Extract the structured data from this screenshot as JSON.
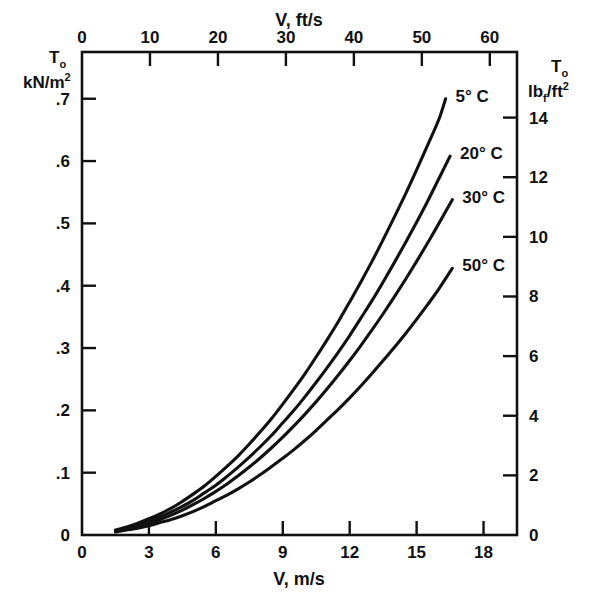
{
  "chart_data": {
    "type": "line",
    "title": "",
    "xlabel": "V, m/s",
    "xlabel_top": "V, ft/s",
    "ylabel": "T_o kN/m^2",
    "ylabel_right": "T_o lb_f/ft^2",
    "xlim": [
      0,
      19.5
    ],
    "ylim": [
      0,
      0.775
    ],
    "xlim_top_fts": [
      0,
      64
    ],
    "ylim_right_lbfft2": [
      0,
      16.2
    ],
    "grid": false,
    "legend_position": "inline-right-of-curve-ends",
    "x_ticks": [
      0,
      3,
      6,
      9,
      12,
      15,
      18
    ],
    "x_tick_labels": [
      "0",
      "3",
      "6",
      "9",
      "12",
      "15",
      "18"
    ],
    "x_ticks_top_fts": [
      0,
      10,
      20,
      30,
      40,
      50,
      60
    ],
    "x_tick_labels_top": [
      "0",
      "10",
      "20",
      "30",
      "40",
      "50",
      "60"
    ],
    "y_ticks": [
      0,
      0.1,
      0.2,
      0.3,
      0.4,
      0.5,
      0.6,
      0.7
    ],
    "y_tick_labels": [
      "0",
      ".1",
      ".2",
      ".3",
      ".4",
      ".5",
      ".6",
      ".7"
    ],
    "y_ticks_right": [
      0,
      2,
      4,
      6,
      8,
      10,
      12,
      14
    ],
    "y_tick_labels_right": [
      "0",
      "2",
      "4",
      "6",
      "8",
      "10",
      "12",
      "14"
    ],
    "series": [
      {
        "name": "5° C",
        "label": "5° C",
        "x": [
          1.5,
          2.0,
          2.5,
          3.0,
          3.5,
          4.0,
          4.5,
          5.0,
          5.5,
          6.0,
          6.5,
          7.0,
          7.5,
          8.0,
          8.5,
          9.0,
          9.5,
          10.0,
          10.5,
          11.0,
          11.5,
          12.0,
          12.5,
          13.0,
          13.5,
          14.0,
          14.5,
          15.0,
          15.5,
          16.0,
          16.3
        ],
        "y": [
          0.008,
          0.013,
          0.019,
          0.026,
          0.034,
          0.043,
          0.054,
          0.066,
          0.079,
          0.094,
          0.11,
          0.127,
          0.146,
          0.166,
          0.187,
          0.21,
          0.234,
          0.259,
          0.286,
          0.314,
          0.343,
          0.374,
          0.406,
          0.439,
          0.474,
          0.51,
          0.547,
          0.586,
          0.626,
          0.667,
          0.7
        ]
      },
      {
        "name": "20° C",
        "label": "20° C",
        "x": [
          1.5,
          2.0,
          2.5,
          3.0,
          3.5,
          4.0,
          4.5,
          5.0,
          5.5,
          6.0,
          6.5,
          7.0,
          7.5,
          8.0,
          8.5,
          9.0,
          9.5,
          10.0,
          10.5,
          11.0,
          11.5,
          12.0,
          12.5,
          13.0,
          13.5,
          14.0,
          14.5,
          15.0,
          15.5,
          16.0,
          16.5
        ],
        "y": [
          0.007,
          0.011,
          0.016,
          0.022,
          0.029,
          0.037,
          0.046,
          0.056,
          0.068,
          0.08,
          0.094,
          0.109,
          0.125,
          0.142,
          0.16,
          0.18,
          0.2,
          0.222,
          0.245,
          0.269,
          0.294,
          0.32,
          0.348,
          0.376,
          0.406,
          0.437,
          0.469,
          0.502,
          0.536,
          0.572,
          0.608
        ]
      },
      {
        "name": "30° C",
        "label": "30° C",
        "x": [
          1.5,
          2.0,
          2.5,
          3.0,
          3.5,
          4.0,
          4.5,
          5.0,
          5.5,
          6.0,
          6.5,
          7.0,
          7.5,
          8.0,
          8.5,
          9.0,
          9.5,
          10.0,
          10.5,
          11.0,
          11.5,
          12.0,
          12.5,
          13.0,
          13.5,
          14.0,
          14.5,
          15.0,
          15.5,
          16.0,
          16.6
        ],
        "y": [
          0.006,
          0.01,
          0.014,
          0.019,
          0.025,
          0.032,
          0.04,
          0.049,
          0.059,
          0.07,
          0.082,
          0.095,
          0.109,
          0.124,
          0.14,
          0.157,
          0.175,
          0.194,
          0.214,
          0.235,
          0.257,
          0.28,
          0.304,
          0.329,
          0.355,
          0.382,
          0.41,
          0.439,
          0.469,
          0.5,
          0.538
        ]
      },
      {
        "name": "50° C",
        "label": "50° C",
        "x": [
          1.5,
          2.0,
          2.5,
          3.0,
          3.5,
          4.0,
          4.5,
          5.0,
          5.5,
          6.0,
          6.5,
          7.0,
          7.5,
          8.0,
          8.5,
          9.0,
          9.5,
          10.0,
          10.5,
          11.0,
          11.5,
          12.0,
          12.5,
          13.0,
          13.5,
          14.0,
          14.5,
          15.0,
          15.5,
          16.0,
          16.6
        ],
        "y": [
          0.005,
          0.008,
          0.011,
          0.015,
          0.02,
          0.025,
          0.031,
          0.038,
          0.046,
          0.055,
          0.064,
          0.074,
          0.085,
          0.097,
          0.11,
          0.123,
          0.137,
          0.152,
          0.168,
          0.185,
          0.202,
          0.22,
          0.239,
          0.259,
          0.28,
          0.301,
          0.323,
          0.346,
          0.37,
          0.395,
          0.428
        ]
      }
    ]
  },
  "axes": {
    "left": {
      "symbol": "T",
      "symbol_sub": "o",
      "unit_main": "kN/m",
      "unit_sup": "2"
    },
    "right": {
      "symbol": "T",
      "symbol_sub": "o",
      "unit_main": "lb",
      "unit_sub": "f",
      "unit_tail": "/ft",
      "unit_sup": "2"
    },
    "top": {
      "title": "V, ft/s"
    },
    "bottom": {
      "title": "V, m/s"
    }
  },
  "colors": {
    "ink": "#111111",
    "paper": "#ffffff"
  }
}
